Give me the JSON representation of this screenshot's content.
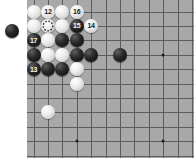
{
  "board": {
    "background_color": "#a8a8a8",
    "line_color": "#5c5c5c",
    "page_background": "#ffffff",
    "left": 27,
    "top": 0,
    "width": 167,
    "height": 158,
    "cell_size": 14.4,
    "origin_x": 33.5,
    "origin_y": 11.5,
    "columns": 11,
    "rows": 10,
    "star_points": [
      {
        "col": 3,
        "row": 3
      },
      {
        "col": 9,
        "row": 3
      },
      {
        "col": 3,
        "row": 9
      },
      {
        "col": 9,
        "row": 9
      }
    ],
    "stone_radius": 7
  },
  "stones": [
    {
      "id": "w-c0r0",
      "col": 0,
      "row": 0,
      "color": "white",
      "label": ""
    },
    {
      "id": "w-c1r0",
      "col": 1,
      "row": 0,
      "color": "white",
      "label": "12"
    },
    {
      "id": "w-c2r0",
      "col": 2,
      "row": 0,
      "color": "white",
      "label": ""
    },
    {
      "id": "w-c3r0",
      "col": 3,
      "row": 0,
      "color": "white",
      "label": "16"
    },
    {
      "id": "w-c0r1",
      "col": 0,
      "row": 1,
      "color": "white",
      "label": ""
    },
    {
      "id": "w-c1r1",
      "col": 1,
      "row": 1,
      "color": "white",
      "label": ""
    },
    {
      "id": "w-c2r1",
      "col": 2,
      "row": 1,
      "color": "white",
      "label": ""
    },
    {
      "id": "b-c3r1",
      "col": 3,
      "row": 1,
      "color": "black",
      "label": "15"
    },
    {
      "id": "w-c4r1",
      "col": 4,
      "row": 1,
      "color": "white",
      "label": "14"
    },
    {
      "id": "b-c0r2",
      "col": 0,
      "row": 2,
      "color": "black",
      "label": "17"
    },
    {
      "id": "w-c1r2",
      "col": 1,
      "row": 2,
      "color": "white",
      "label": ""
    },
    {
      "id": "b-c2r2",
      "col": 2,
      "row": 2,
      "color": "black",
      "label": ""
    },
    {
      "id": "b-c3r2",
      "col": 3,
      "row": 2,
      "color": "black",
      "label": ""
    },
    {
      "id": "b-c0r3",
      "col": 0,
      "row": 3,
      "color": "black",
      "label": ""
    },
    {
      "id": "w-c1r3",
      "col": 1,
      "row": 3,
      "color": "white",
      "label": ""
    },
    {
      "id": "w-c2r3",
      "col": 2,
      "row": 3,
      "color": "white",
      "label": ""
    },
    {
      "id": "b-c3r3",
      "col": 3,
      "row": 3,
      "color": "black",
      "label": ""
    },
    {
      "id": "b-c4r3",
      "col": 4,
      "row": 3,
      "color": "black",
      "label": ""
    },
    {
      "id": "b-c6r3",
      "col": 6,
      "row": 3,
      "color": "black",
      "label": ""
    },
    {
      "id": "b-c0r4",
      "col": 0,
      "row": 4,
      "color": "black",
      "label": "13"
    },
    {
      "id": "b-c1r4",
      "col": 1,
      "row": 4,
      "color": "black",
      "label": ""
    },
    {
      "id": "b-c2r4",
      "col": 2,
      "row": 4,
      "color": "black",
      "label": ""
    },
    {
      "id": "w-c3r4",
      "col": 3,
      "row": 4,
      "color": "white",
      "label": ""
    },
    {
      "id": "w-c3r5",
      "col": 3,
      "row": 5,
      "color": "white",
      "label": ""
    },
    {
      "id": "w-c1r7",
      "col": 1,
      "row": 7,
      "color": "white",
      "label": ""
    }
  ],
  "markers": [
    {
      "id": "dashed-circle-marker",
      "col": 1,
      "row": 1,
      "shape": "dashed-circle",
      "color": "#262626"
    }
  ],
  "offboard_stones": [
    {
      "id": "prisoner-black-1",
      "x": 12,
      "y": 31,
      "color": "black",
      "radius": 7
    }
  ]
}
